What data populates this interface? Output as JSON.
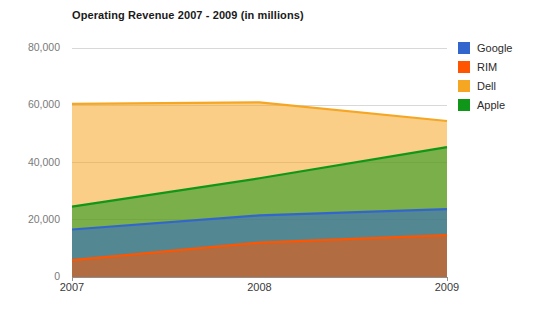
{
  "chart_data": {
    "type": "area",
    "title": "Operating Revenue 2007 - 2009 (in millions)",
    "xlabel": "",
    "ylabel": "",
    "categories": [
      "2007",
      "2008",
      "2009"
    ],
    "x": [
      2007,
      2008,
      2009
    ],
    "ylim": [
      0,
      80000
    ],
    "xlim": [
      2007,
      2009
    ],
    "yticks": [
      0,
      20000,
      40000,
      60000,
      80000
    ],
    "ytick_labels": [
      "0",
      "20,000",
      "40,000",
      "60,000",
      "80,000"
    ],
    "xtick_labels": [
      "2007",
      "2008",
      "2009"
    ],
    "grid": true,
    "grid_axis": "y",
    "stacked": false,
    "fill_opacity": 0.55,
    "legend_position": "right",
    "series": [
      {
        "name": "Google",
        "color": "#3366cc",
        "values": [
          16600,
          21500,
          23700
        ]
      },
      {
        "name": "RIM",
        "color": "#ff5500",
        "values": [
          5900,
          12000,
          14600
        ]
      },
      {
        "name": "Dell",
        "color": "#f5a623",
        "values": [
          60500,
          61000,
          54500
        ]
      },
      {
        "name": "Apple",
        "color": "#109618",
        "values": [
          24600,
          34500,
          45400
        ]
      }
    ]
  },
  "legend": {
    "items": [
      {
        "label": "Google",
        "color": "#3366cc",
        "swatch_name": "legend-swatch-google"
      },
      {
        "label": "RIM",
        "color": "#ff5500",
        "swatch_name": "legend-swatch-rim"
      },
      {
        "label": "Dell",
        "color": "#f5a623",
        "swatch_name": "legend-swatch-dell"
      },
      {
        "label": "Apple",
        "color": "#109618",
        "swatch_name": "legend-swatch-apple"
      }
    ]
  },
  "axes": {
    "y_labels": [
      "80,000",
      "60,000",
      "40,000",
      "20,000",
      "0"
    ],
    "x_labels": [
      "2007",
      "2008",
      "2009"
    ]
  }
}
